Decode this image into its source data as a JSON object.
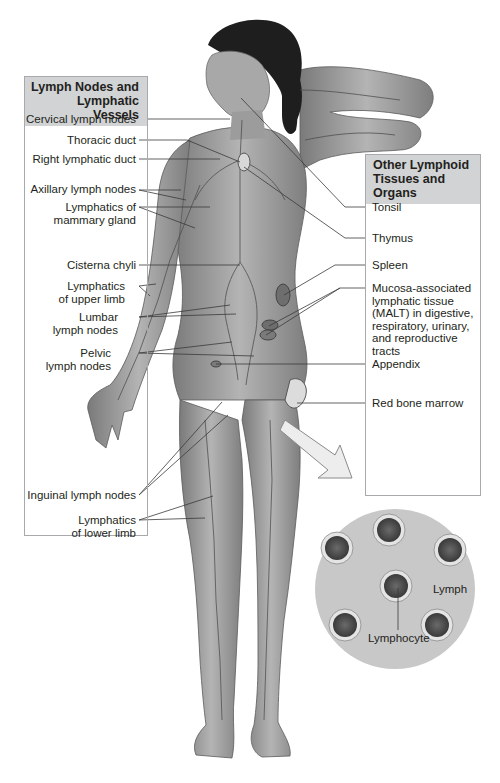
{
  "diagram": {
    "left_panel": {
      "title_line1": "Lymph Nodes and",
      "title_line2": "Lymphatic Vessels",
      "labels": [
        {
          "line1": "Cervical lymph nodes",
          "line2": ""
        },
        {
          "line1": "Thoracic duct",
          "line2": ""
        },
        {
          "line1": "Right lymphatic duct",
          "line2": ""
        },
        {
          "line1": "Axillary lymph nodes",
          "line2": ""
        },
        {
          "line1": "Lymphatics of",
          "line2": "mammary gland"
        },
        {
          "line1": "Cisterna chyli",
          "line2": ""
        },
        {
          "line1": "Lymphatics",
          "line2": "of upper limb"
        },
        {
          "line1": "Lumbar",
          "line2": "lymph nodes"
        },
        {
          "line1": "Pelvic",
          "line2": "lymph nodes"
        },
        {
          "line1": "Inguinal lymph nodes",
          "line2": ""
        },
        {
          "line1": "Lymphatics",
          "line2": "of lower limb"
        }
      ]
    },
    "right_panel": {
      "title_line1": "Other Lymphoid",
      "title_line2": "Tissues and Organs",
      "labels": [
        {
          "lines": [
            "Tonsil"
          ]
        },
        {
          "lines": [
            "Thymus"
          ]
        },
        {
          "lines": [
            "Spleen"
          ]
        },
        {
          "lines": [
            "Mucosa-associated",
            "lymphatic tissue",
            "(MALT) in digestive,",
            "respiratory, urinary,",
            "and reproductive",
            "tracts"
          ]
        },
        {
          "lines": [
            "Appendix"
          ]
        },
        {
          "lines": [
            "Red bone marrow"
          ]
        }
      ]
    },
    "magnified_view": {
      "fluid_label": "Lymph",
      "cell_label": "Lymphocyte",
      "cell_count": 6
    },
    "colors": {
      "header_fill": "#d1d3d4",
      "box_border": "#a7a9ac",
      "skin": "#9a9a9a",
      "vessel": "#4d4d4d",
      "hair": "#1e1e1e",
      "magnified_bg": "#c8c8c8",
      "leader": "#3a3a3a"
    }
  }
}
